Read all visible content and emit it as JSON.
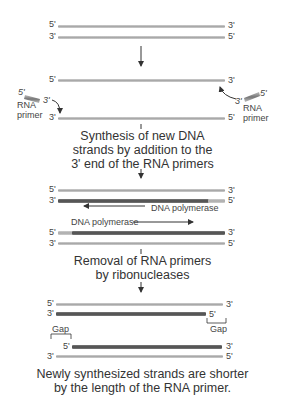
{
  "ends": {
    "five": "5'",
    "three": "3'"
  },
  "labels": {
    "rna_primer": [
      "RNA",
      "primer"
    ],
    "dna_polymerase": "DNA polymerase",
    "gap": "Gap"
  },
  "captions": {
    "synthesis": [
      "Synthesis of new DNA",
      "strands by addition to the",
      "3' end of the RNA primers"
    ],
    "removal": [
      "Removal of RNA primers",
      "by ribonucleases"
    ],
    "result": [
      "Newly synthesized strands are shorter",
      "by the length of the RNA primer."
    ]
  },
  "colors": {
    "old_strand": "#b0b0b0",
    "new_strand": "#555555",
    "arrow": "#333333"
  }
}
